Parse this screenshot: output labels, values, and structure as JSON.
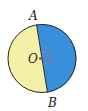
{
  "diagram": {
    "type": "circle-diameter",
    "labels": {
      "top_point": "A",
      "bottom_point": "B",
      "center": "O"
    },
    "colors": {
      "left_half": "#f5f0a8",
      "right_half": "#3a8fdc",
      "outline": "#2a2a2a",
      "center_dot": "#e04040",
      "angle_arc": "#e06060"
    }
  }
}
